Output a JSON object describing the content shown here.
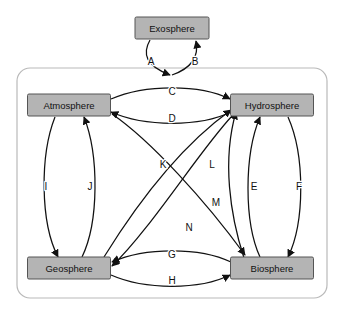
{
  "diagram": {
    "container": {
      "name": "earth-system-boundary"
    },
    "colors": {
      "node_fill": "#b4b4b4",
      "node_stroke": "#555555",
      "edge_stroke": "#111111",
      "container_stroke": "#b9b9b9",
      "background": "#ffffff"
    },
    "nodes": [
      {
        "id": "exosphere",
        "label": "Exosphere",
        "x": 172,
        "y": 28,
        "w": 74,
        "h": 22
      },
      {
        "id": "atmosphere",
        "label": "Atmosphere",
        "x": 69,
        "y": 105,
        "w": 83,
        "h": 22
      },
      {
        "id": "hydrosphere",
        "label": "Hydrosphere",
        "x": 272,
        "y": 105,
        "w": 83,
        "h": 22
      },
      {
        "id": "geosphere",
        "label": "Geosphere",
        "x": 69,
        "y": 268,
        "w": 83,
        "h": 22
      },
      {
        "id": "biosphere",
        "label": "Biosphere",
        "x": 272,
        "y": 268,
        "w": 83,
        "h": 22
      }
    ],
    "edges": [
      {
        "id": "A",
        "label": "A",
        "from": "exosphere",
        "to": "earth-system",
        "lx": 151,
        "ly": 62
      },
      {
        "id": "B",
        "label": "B",
        "from": "earth-system",
        "to": "exosphere",
        "lx": 195,
        "ly": 62
      },
      {
        "id": "C",
        "label": "C",
        "from": "atmosphere",
        "to": "hydrosphere",
        "lx": 172,
        "ly": 93
      },
      {
        "id": "D",
        "label": "D",
        "from": "hydrosphere",
        "to": "atmosphere",
        "lx": 172,
        "ly": 119
      },
      {
        "id": "E",
        "label": "E",
        "from": "biosphere",
        "to": "hydrosphere",
        "lx": 254,
        "ly": 187
      },
      {
        "id": "F",
        "label": "F",
        "from": "hydrosphere",
        "to": "biosphere",
        "lx": 299,
        "ly": 187
      },
      {
        "id": "G",
        "label": "G",
        "from": "biosphere",
        "to": "geosphere",
        "lx": 172,
        "ly": 255
      },
      {
        "id": "H",
        "label": "H",
        "from": "geosphere",
        "to": "biosphere",
        "lx": 172,
        "ly": 281
      },
      {
        "id": "I",
        "label": "I",
        "from": "atmosphere",
        "to": "geosphere",
        "lx": 46,
        "ly": 187
      },
      {
        "id": "J",
        "label": "J",
        "from": "geosphere",
        "to": "atmosphere",
        "lx": 90,
        "ly": 187
      },
      {
        "id": "K",
        "label": "K",
        "from": "geosphere",
        "to": "hydrosphere",
        "lx": 163,
        "ly": 165
      },
      {
        "id": "L",
        "label": "L",
        "from": "biosphere",
        "to": "hydrosphere",
        "lx": 212,
        "ly": 165
      },
      {
        "id": "M",
        "label": "M",
        "from": "atmosphere",
        "to": "biosphere",
        "lx": 216,
        "ly": 203
      },
      {
        "id": "N",
        "label": "N",
        "from": "hydrosphere",
        "to": "geosphere",
        "lx": 189,
        "ly": 228
      }
    ]
  }
}
